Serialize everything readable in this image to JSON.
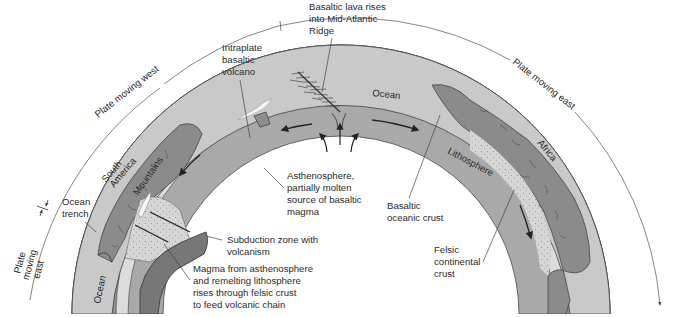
{
  "diagram": {
    "geometry": {
      "cx": 341,
      "cy": 338,
      "r_outer": 269,
      "r_crust_top": 230,
      "r_crust_bottom": 225,
      "r_litho_bottom": 213,
      "r_inner": 178,
      "r_guide": 324
    },
    "colors": {
      "ocean": "#c9c9c9",
      "oceanic_crust": "#8e8e8e",
      "lithosphere": "#dcdcdc",
      "asthenosphere": "#a9a9a9",
      "continent": "#8b8b8b",
      "continental_crust_speckle": "#d3d3d3",
      "subducting_slab": "#777777",
      "volcano_lava": "#f4f4f4",
      "line": "#333333"
    },
    "motion_labels": {
      "west": "Plate moving west",
      "east": "Plate moving east",
      "far_east_line1": "Plate",
      "far_east_line2": "moving",
      "far_east_line3": "east"
    },
    "region_labels": {
      "ocean_top": "Ocean",
      "ocean_left": "Ocean",
      "south_america_line1": "South",
      "south_america_line2": "America",
      "mountains": "Mountains",
      "africa": "Africa",
      "lithosphere": "Lithosphere"
    },
    "callouts": {
      "ridge": [
        "Basaltic lava rises",
        "into Mid-Atlantic",
        "Ridge"
      ],
      "intraplate": [
        "Intraplate",
        "basaltic",
        "volcano"
      ],
      "trench": [
        "Ocean",
        "trench"
      ],
      "asthenosphere": [
        "Asthenosphere,",
        "partially molten",
        "source of basaltic",
        "magma"
      ],
      "basaltic_crust": [
        "Basaltic",
        "oceanic crust"
      ],
      "subduction": [
        "Subduction zone with",
        "volcanism"
      ],
      "magma": [
        "Magma from asthenosphere",
        "and remelting lithosphere",
        "rises through felsic crust",
        "to feed volcanic chain"
      ],
      "felsic": [
        "Felsic",
        "continental",
        "crust"
      ]
    }
  }
}
